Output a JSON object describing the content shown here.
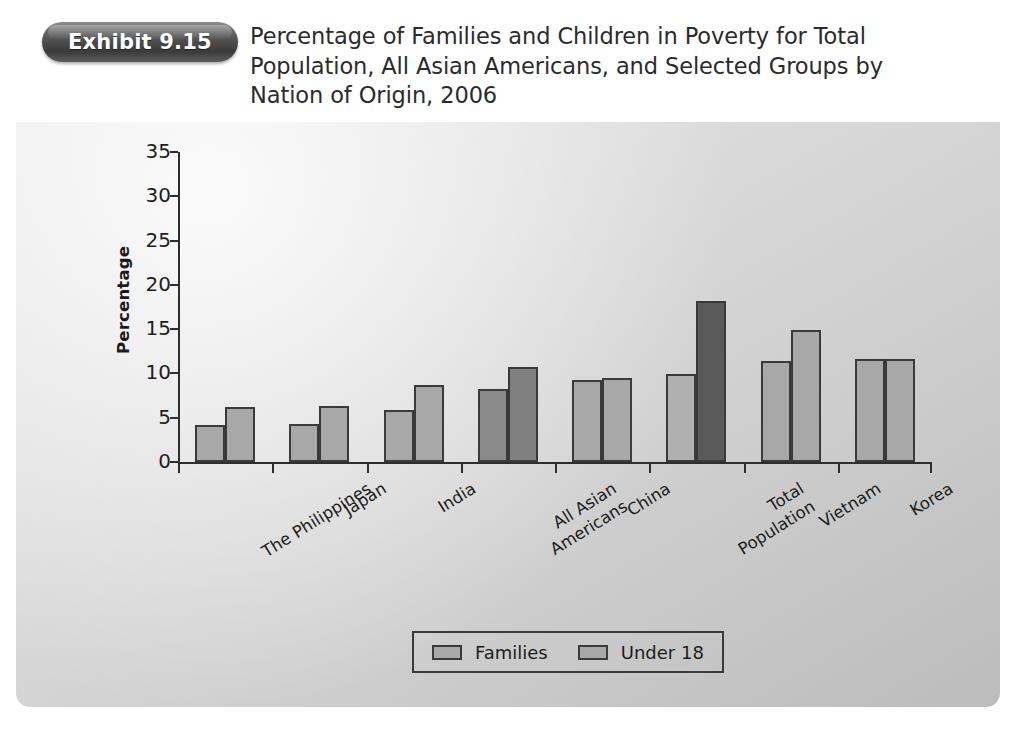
{
  "exhibit": {
    "badge_label": "Exhibit 9.15"
  },
  "title": "Percentage of Families and Children in Poverty for Total Population, All Asian Americans, and Selected Groups by Nation of Origin, 2006",
  "chart_data": {
    "type": "bar",
    "title": "Percentage of Families and Children in Poverty for Total Population, All Asian Americans, and Selected Groups by Nation of Origin, 2006",
    "xlabel": "",
    "ylabel": "Percentage",
    "ylim": [
      0,
      35
    ],
    "yticks": [
      "0",
      "5",
      "10",
      "15",
      "20",
      "25",
      "30",
      "35"
    ],
    "grid": false,
    "legend_position": "bottom-center",
    "categories": [
      "The Philippines",
      "Japan",
      "India",
      "All Asian Americans",
      "China",
      "Total Population",
      "Vietnam",
      "Korea"
    ],
    "category_lines": [
      [
        "The Philippines"
      ],
      [
        "Japan"
      ],
      [
        "India"
      ],
      [
        "All Asian",
        "Americans"
      ],
      [
        "China"
      ],
      [
        "Total",
        "Population"
      ],
      [
        "Vietnam"
      ],
      [
        "Korea"
      ]
    ],
    "series": [
      {
        "name": "Families",
        "values": [
          4.2,
          4.3,
          5.9,
          8.3,
          9.3,
          9.9,
          11.4,
          11.6
        ],
        "color": "#a8a8a8",
        "highlight_colors": {
          "3": "#8a8a8a",
          "5": "#b0b0b0"
        }
      },
      {
        "name": "Under 18",
        "values": [
          6.2,
          6.3,
          8.7,
          10.7,
          9.5,
          18.2,
          14.9,
          11.6
        ],
        "color": "#a8a8a8",
        "highlight_colors": {
          "3": "#808080",
          "5": "#5a5a5a"
        }
      }
    ]
  },
  "legend": {
    "items": [
      {
        "label": "Families",
        "color": "#a8a8a8"
      },
      {
        "label": "Under 18",
        "color": "#a8a8a8"
      }
    ]
  },
  "colors": {
    "panel_light": "#e6e6e6",
    "panel_dark": "#bcbcbc",
    "bar_default": "#a8a8a8",
    "bar_dark": "#808080",
    "bar_darkest": "#5a5a5a",
    "axis": "#2e2e2e",
    "badge": "#4c4c4c"
  }
}
